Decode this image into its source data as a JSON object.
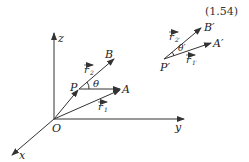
{
  "equation_number": "(1.54)",
  "axes": {
    "x": "x",
    "y": "y",
    "z": "z",
    "origin": "O"
  },
  "points": {
    "P": "P",
    "A": "A",
    "B": "B"
  },
  "vectors": {
    "r1": "r",
    "r1_sub": "1",
    "r2": "r",
    "r2_sub": "2"
  },
  "angle": "θ",
  "primed": {
    "P": "P′",
    "A": "A′",
    "B": "B′",
    "r1": "r",
    "r1_sub": "1′",
    "r2": "r",
    "r2_sub": "2′",
    "angle": "θ′"
  }
}
